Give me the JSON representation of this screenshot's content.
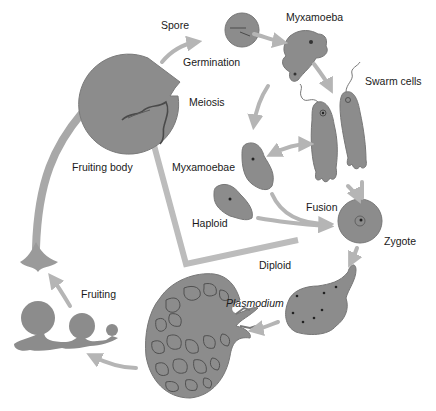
{
  "diagram": {
    "colors": {
      "cell_fill": "#8a8a8a",
      "cell_dark": "#6e6e6e",
      "outline": "#555555",
      "arrow": "#b5b5b5",
      "bracket": "#b8b8b8",
      "text": "#1a1a1a",
      "background": "#ffffff"
    },
    "labels": {
      "spore": "Spore",
      "germination": "Germination",
      "myxamoeba": "Myxamoeba",
      "swarm_cells": "Swarm cells",
      "meiosis": "Meiosis",
      "fruiting_body": "Fruiting body",
      "myxamoebae": "Myxamoebae",
      "haploid": "Haploid",
      "fusion": "Fusion",
      "zygote": "Zygote",
      "diploid": "Diploid",
      "plasmodium": "Plasmodium",
      "fruiting": "Fruiting"
    },
    "stages": [
      "Fruiting body",
      "Meiosis",
      "Spore",
      "Germination",
      "Myxamoeba",
      "Swarm cells",
      "Myxamoebae",
      "Fusion",
      "Zygote",
      "Plasmodium",
      "Fruiting"
    ],
    "phases": [
      "Haploid",
      "Diploid"
    ]
  }
}
